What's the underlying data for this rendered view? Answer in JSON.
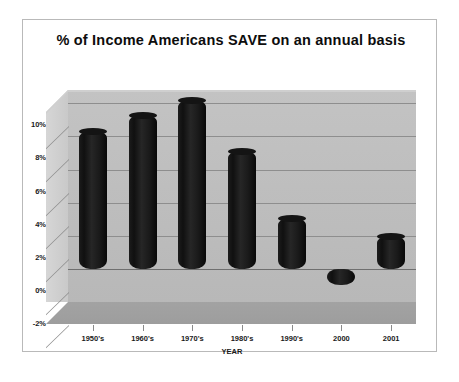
{
  "chart_data": {
    "type": "bar",
    "title": "% of Income Americans SAVE on an annual basis",
    "xlabel": "YEAR",
    "ylabel": "",
    "categories": [
      "1950's",
      "1960's",
      "1970's",
      "1980's",
      "1990's",
      "2000",
      "2001"
    ],
    "values": [
      8.3,
      9.3,
      10.2,
      7.1,
      3.1,
      -1.0,
      2.0
    ],
    "ytick_labels": [
      "10%",
      "8%",
      "6%",
      "4%",
      "2%",
      "0%",
      "-2%"
    ],
    "ytick_values": [
      10,
      8,
      6,
      4,
      2,
      0,
      -2
    ],
    "ylim": [
      -2,
      10.8
    ],
    "grid": true,
    "legend": false,
    "style": "3d-cylinder",
    "colors": {
      "bar": "#141414",
      "plot_background": "#bdbdbd",
      "floor": "#a3a3a3",
      "gridline": "#8e8e8e",
      "card_border": "#b9b9b9",
      "text": "#1a1a1a",
      "page_background": "#ffffff"
    }
  }
}
